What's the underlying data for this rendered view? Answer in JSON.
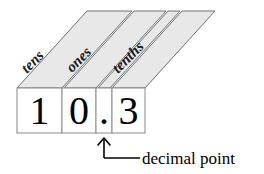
{
  "figure": {
    "number_shown": "10.3",
    "colors": {
      "panel_fill": "#e8e8e8",
      "panel_stroke": "#6e6e6e",
      "cell_fill": "#ffffff",
      "cell_stroke": "#8a8a8a",
      "ink": "#000000",
      "background": "#ffffff"
    }
  },
  "place_panels": [
    {
      "label": "tens",
      "has_label": true
    },
    {
      "label": "ones",
      "has_label": true
    },
    {
      "label": "",
      "has_label": false
    },
    {
      "label": "tenths",
      "has_label": true
    }
  ],
  "digit_cells": [
    {
      "value": "1",
      "kind": "digit",
      "place": "tens"
    },
    {
      "value": "0",
      "kind": "digit",
      "place": "ones"
    },
    {
      "value": ".",
      "kind": "separator",
      "place": "decimal-point"
    },
    {
      "value": "3",
      "kind": "digit",
      "place": "tenths"
    }
  ],
  "annotation": {
    "label": "decimal point",
    "pointer_icon": "up-arrow-icon"
  }
}
